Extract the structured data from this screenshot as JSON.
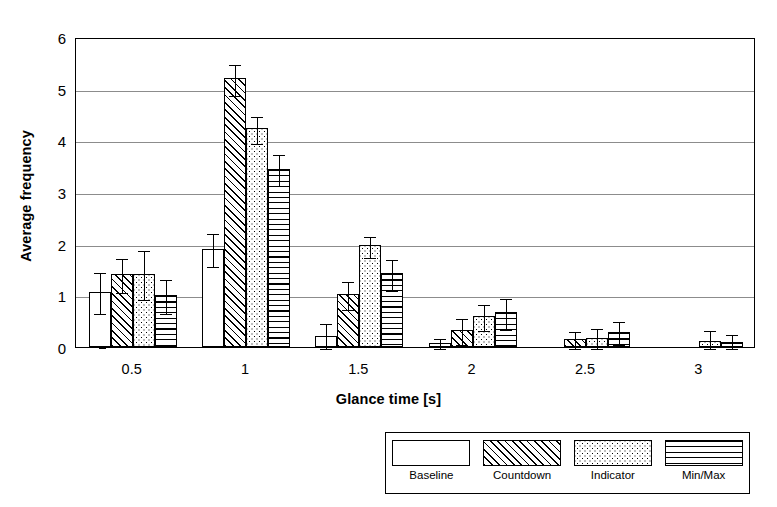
{
  "chart_data": {
    "type": "bar",
    "title": "",
    "xlabel": "Glance time [s]",
    "ylabel": "Average frequency",
    "categories": [
      "0.5",
      "1",
      "1.5",
      "2",
      "2.5",
      "3"
    ],
    "ylim": [
      0,
      6
    ],
    "yticks": [
      "0",
      "1",
      "2",
      "3",
      "4",
      "5",
      "6"
    ],
    "grid": "horizontal",
    "legend_position": "bottom-right",
    "error_bars": "yes",
    "series": [
      {
        "name": "Baseline",
        "pattern": "plain-white",
        "values": [
          1.07,
          1.9,
          0.22,
          0.07,
          0.0,
          0.0
        ],
        "errors": [
          0.4,
          0.32,
          0.26,
          0.13,
          0.0,
          0.0
        ]
      },
      {
        "name": "Countdown",
        "pattern": "diagonal-hatch",
        "values": [
          1.42,
          5.2,
          1.03,
          0.33,
          0.15,
          0.0
        ],
        "errors": [
          0.33,
          0.3,
          0.27,
          0.26,
          0.18,
          0.0
        ]
      },
      {
        "name": "Indicator",
        "pattern": "dotted",
        "values": [
          1.42,
          4.23,
          1.97,
          0.6,
          0.18,
          0.12
        ],
        "errors": [
          0.47,
          0.26,
          0.2,
          0.25,
          0.2,
          0.22
        ]
      },
      {
        "name": "Min/Max",
        "pattern": "horizontal-lines",
        "values": [
          1.0,
          3.45,
          1.43,
          0.67,
          0.3,
          0.1
        ],
        "errors": [
          0.33,
          0.3,
          0.3,
          0.3,
          0.23,
          0.18
        ]
      }
    ]
  },
  "legend": {
    "items": [
      {
        "label": "Baseline",
        "pattern": "plain-white"
      },
      {
        "label": "Countdown",
        "pattern": "diagonal-hatch"
      },
      {
        "label": "Indicator",
        "pattern": "dotted"
      },
      {
        "label": "Min/Max",
        "pattern": "horizontal-lines"
      }
    ]
  },
  "colors": {
    "ink": "#000000",
    "grid": "#8c8c8c",
    "background": "#ffffff"
  }
}
